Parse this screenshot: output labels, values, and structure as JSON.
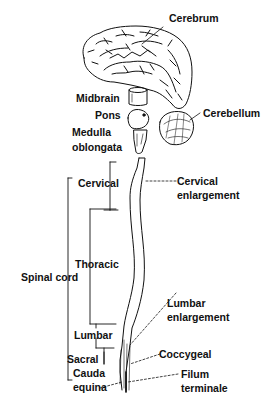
{
  "diagram": {
    "type": "anatomy-illustration",
    "colors": {
      "ink": "#111111",
      "background": "#ffffff"
    },
    "brain_labels": {
      "cerebrum": "Cerebrum",
      "midbrain": "Midbrain",
      "pons": "Pons",
      "medulla_line1": "Medulla",
      "medulla_line2": "oblongata",
      "cerebellum": "Cerebellum"
    },
    "spinal_labels": {
      "cervical": "Cervical",
      "thoracic": "Thoracic",
      "spinal_cord": "Spinal cord",
      "lumbar": "Lumbar",
      "sacral": "Sacral",
      "cauda_line1": "Cauda",
      "cauda_line2": "equina"
    },
    "right_labels": {
      "cervical_enl_line1": "Cervical",
      "cervical_enl_line2": "enlargement",
      "lumbar_enl_line1": "Lumbar",
      "lumbar_enl_line2": "enlargement",
      "coccygeal": "Coccygeal",
      "filum_line1": "Filum",
      "filum_line2": "terminale"
    }
  }
}
